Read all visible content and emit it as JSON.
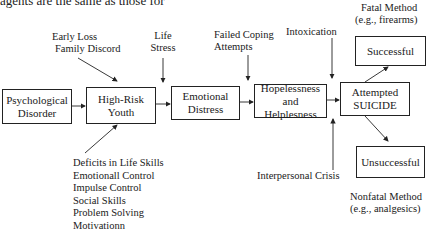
{
  "header": {
    "truncated_text": "agents are the same as those for"
  },
  "boxes": {
    "psych_disorder": {
      "line1": "Psychological",
      "line2": "Disorder"
    },
    "high_risk_youth": {
      "line1": "High-Risk",
      "line2": "Youth"
    },
    "emotional_distress": {
      "line1": "Emotional",
      "line2": "Distress"
    },
    "hopelessness": {
      "line1": "Hopelessness",
      "line2": "and Helplesness"
    },
    "attempted_suicide": {
      "line1": "Attempted",
      "line2": "SUICIDE"
    },
    "successful": {
      "label": "Successful"
    },
    "unsuccessful": {
      "label": "Unsuccessful"
    }
  },
  "factors": {
    "early_loss": {
      "line1": "Early Loss",
      "line2": "Family Discord"
    },
    "life_stress": {
      "line1": "Life",
      "line2": "Stress"
    },
    "failed_coping": {
      "line1": "Failed Coping",
      "line2": "Attempts"
    },
    "intoxication": {
      "label": "Intoxication"
    },
    "interpersonal_crisis": {
      "label": "Interpersonal Crisis"
    },
    "fatal_method": {
      "line1": "Fatal Method",
      "line2": "(e.g., firearms)"
    },
    "nonfatal_method": {
      "line1": "Nonfatal Method",
      "line2": "(e.g., analgesics)"
    },
    "deficits": {
      "items": [
        "Deficits in Life Skills",
        "Emotionall Control",
        "Impulse Control",
        "Social Skills",
        "Problem Solving",
        "Motivationn"
      ]
    }
  }
}
